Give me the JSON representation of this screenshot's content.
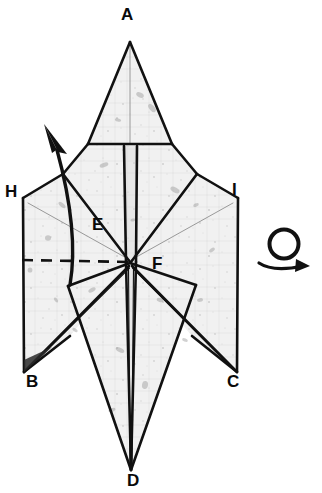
{
  "diagram": {
    "kind": "origami-folding-step",
    "background_color": "#ffffff",
    "paper_fill_color": "#f1f1f1",
    "paper_shade_color": "#e6e6e6",
    "line_color": "#111111",
    "crease_color": "#8a8a8a",
    "label_color": "#0a0a0a"
  },
  "vertex_labels": [
    {
      "id": "A",
      "text": "A",
      "x": 121,
      "y": 6
    },
    {
      "id": "H",
      "text": "H",
      "x": 5,
      "y": 183
    },
    {
      "id": "I",
      "text": "I",
      "x": 232,
      "y": 181
    },
    {
      "id": "E",
      "text": "E",
      "x": 92,
      "y": 216
    },
    {
      "id": "F",
      "text": "F",
      "x": 152,
      "y": 255
    },
    {
      "id": "B",
      "text": "B",
      "x": 26,
      "y": 373
    },
    {
      "id": "C",
      "text": "C",
      "x": 227,
      "y": 373
    },
    {
      "id": "D",
      "text": "D",
      "x": 127,
      "y": 472
    }
  ],
  "symbols": [
    {
      "id": "fold-arrow",
      "name": "curved-fold-arrow",
      "meaning": "valley fold / lift flap upward",
      "x": 40,
      "y": 125
    },
    {
      "id": "turn-over-symbol",
      "name": "turn-over-loop-arrow",
      "meaning": "turn the model over",
      "x": 258,
      "y": 232
    },
    {
      "id": "fold-line-dashed",
      "name": "dashed-fold-line",
      "meaning": "existing crease / fold location",
      "x1": 22,
      "y1": 260,
      "x2": 130,
      "y2": 262
    }
  ],
  "caption": ""
}
